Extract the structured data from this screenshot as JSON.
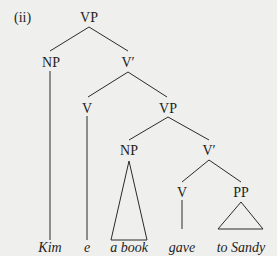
{
  "example_label": "(ii)",
  "tree": {
    "nodes": {
      "root_vp": "VP",
      "subj_np": "NP",
      "vbar_upper": "V′",
      "v_empty": "V",
      "vp_lower": "VP",
      "obj_np": "NP",
      "vbar_lower": "V′",
      "v_gave": "V",
      "pp": "PP"
    },
    "leaves": {
      "kim": "Kim",
      "e": "e",
      "a_book": "a book",
      "gave": "gave",
      "to_sandy": "to Sandy"
    }
  },
  "colors": {
    "background": "#efefed",
    "ink": "#1e1e1e"
  }
}
